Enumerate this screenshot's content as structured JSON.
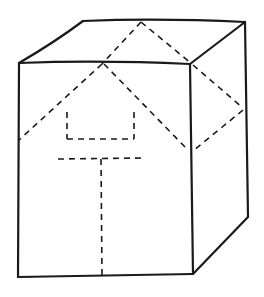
{
  "figure": {
    "title": "",
    "colors": {
      "background": "#ffffff",
      "ink": "#1a1a1a"
    },
    "solid_edges": [
      "front-top",
      "front-left",
      "front-bottom",
      "front-right",
      "top-back",
      "top-left-slant",
      "top-right-slant",
      "side-back-vertical",
      "side-bottom-slant"
    ],
    "dashed_lines": [
      "top-face-left-diagonal",
      "top-face-right-diagonal",
      "front-roof-left",
      "front-roof-right",
      "side-diamond-upper",
      "side-diamond-lower",
      "front-bracket-left",
      "front-bracket-bottom",
      "front-bracket-right",
      "front-t-horizontal",
      "front-t-vertical"
    ]
  }
}
